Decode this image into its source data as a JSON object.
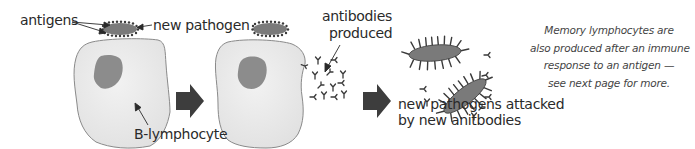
{
  "diagram": {
    "type": "flow",
    "colors": {
      "background": "#ffffff",
      "cell_fill": "#e6e6e6",
      "cell_stroke": "#8a8a8a",
      "nucleus_fill": "#8c8c8c",
      "pathogen_fill": "#7a7a7a",
      "antigen_dots": "#3a3a3a",
      "arrow_fill": "#3d3d3d",
      "text": "#2a2a2a"
    },
    "labels": {
      "antigens": "antigens",
      "new_pathogen": "new pathogen",
      "b_lymphocyte": "B-lymphocyte",
      "antibodies_line1": "antibodies",
      "antibodies_line2": "produced",
      "attacked_line1": "new pathogens attacked",
      "attacked_line2": "by new anitbodies"
    },
    "note": {
      "line1": "Memory lymphocytes are",
      "line2": "also produced after an immune",
      "line3": "response to an antigen —",
      "line4": "see next page for more."
    },
    "stages": [
      {
        "id": 1,
        "name": "B-lymphocyte with new pathogen attached"
      },
      {
        "id": 2,
        "name": "B-lymphocyte producing antibodies"
      },
      {
        "id": 3,
        "name": "New pathogens attacked by antibodies"
      }
    ]
  }
}
